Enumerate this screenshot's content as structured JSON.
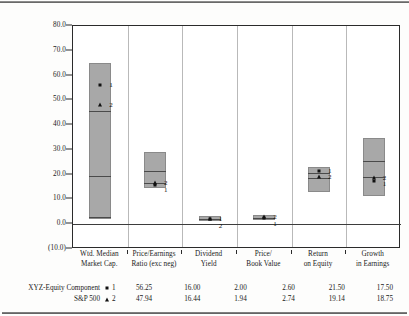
{
  "figure": {
    "ghost_text_top": "",
    "y_axis": {
      "ticks": [
        "80.0",
        "70.0",
        "60.0",
        "50.0",
        "40.0",
        "30.0",
        "20.0",
        "10.0",
        "0.0",
        "(10.0)"
      ],
      "min": -10,
      "max": 80,
      "step": 10
    },
    "categories": [
      {
        "line1": "Wtd. Median",
        "line2": "Market Cap."
      },
      {
        "line1": "Price/Earnings",
        "line2": "Ratio (exc neg)"
      },
      {
        "line1": "Dividend",
        "line2": "Yield"
      },
      {
        "line1": "Price/",
        "line2": "Book Value"
      },
      {
        "line1": "Return",
        "line2": "on Equity"
      },
      {
        "line1": "Growth",
        "line2": "in Earnings"
      }
    ],
    "legend": [
      {
        "name": "XYZ-Equity Component",
        "symbol": "square",
        "key": "1"
      },
      {
        "name": "S&P 500",
        "symbol": "triangle",
        "key": "2"
      }
    ]
  },
  "chart_data": {
    "type": "bar",
    "title": "",
    "xlabel": "",
    "ylabel": "",
    "ylim": [
      -10,
      80
    ],
    "yticks": [
      80,
      70,
      60,
      50,
      40,
      30,
      20,
      10,
      0,
      -10
    ],
    "grid": false,
    "legend_position": "bottom-left",
    "categories": [
      "Wtd. Median Market Cap.",
      "Price/Earnings Ratio (exc neg)",
      "Dividend Yield",
      "Price/ Book Value",
      "Return on Equity",
      "Growth in Earnings"
    ],
    "boxes": [
      {
        "category": "Wtd. Median Market Cap.",
        "low": 2.0,
        "high": 65.0,
        "dividers": [
          3.0,
          19.5,
          45.5
        ]
      },
      {
        "category": "Price/Earnings Ratio (exc neg)",
        "low": 14.5,
        "high": 29.0,
        "dividers": [
          16.5,
          21.5
        ]
      },
      {
        "category": "Dividend Yield",
        "low": 1.2,
        "high": 3.2,
        "dividers": [
          2.1
        ]
      },
      {
        "category": "Price/ Book Value",
        "low": 1.8,
        "high": 3.6,
        "dividers": [
          2.7
        ]
      },
      {
        "category": "Return on Equity",
        "low": 13.0,
        "high": 23.0,
        "dividers": [
          18.5,
          20.8
        ]
      },
      {
        "category": "Growth in Earnings",
        "low": 11.5,
        "high": 35.0,
        "dividers": [
          19.0,
          25.5
        ]
      }
    ],
    "series": [
      {
        "name": "XYZ-Equity Component",
        "key": "1",
        "marker": "square",
        "values": [
          56.25,
          16.0,
          2.0,
          2.6,
          21.5,
          17.5
        ],
        "value_labels": [
          "56.25",
          "16.00",
          "2.00",
          "2.60",
          "21.50",
          "17.50"
        ]
      },
      {
        "name": "S&P 500",
        "key": "2",
        "marker": "triangle",
        "values": [
          47.94,
          16.44,
          1.94,
          2.74,
          19.14,
          18.75
        ],
        "value_labels": [
          "47.94",
          "16.44",
          "1.94",
          "2.74",
          "19.14",
          "18.75"
        ]
      }
    ]
  }
}
